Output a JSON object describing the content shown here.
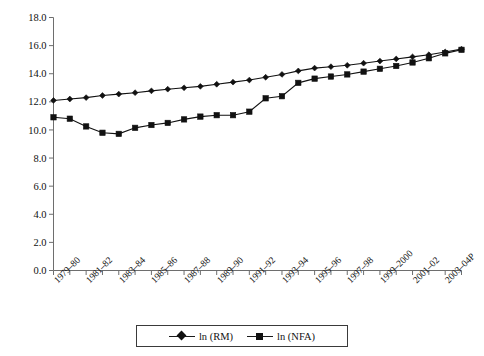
{
  "chart_data": {
    "type": "line",
    "title": "",
    "subtitle": "",
    "xlabel": "",
    "ylabel": "",
    "ylim": [
      0.0,
      18.0
    ],
    "ytick_step": 2.0,
    "ytick_labels": [
      "0.0",
      "2.0",
      "4.0",
      "6.0",
      "8.0",
      "10.0",
      "12.0",
      "14.0",
      "16.0",
      "18.0"
    ],
    "ytick_values": [
      0.0,
      2.0,
      4.0,
      6.0,
      8.0,
      10.0,
      12.0,
      14.0,
      16.0,
      18.0
    ],
    "grid": false,
    "legend_position": "below-axis-center",
    "x": [
      "1979-80",
      "1980-81",
      "1981-82",
      "1982-83",
      "1983-84",
      "1984-85",
      "1985-86",
      "1986-87",
      "1987-88",
      "1988-89",
      "1989-90",
      "1990-91",
      "1991-92",
      "1992-93",
      "1993-94",
      "1994-95",
      "1995-96",
      "1996-97",
      "1997-98",
      "1998-99",
      "1999-2000",
      "2000-01",
      "2001-02",
      "2002-03",
      "2003-04P",
      "2004-05P"
    ],
    "xtick_labels_shown": [
      "1979-80",
      "1981-82",
      "1983-84",
      "1985-86",
      "1987-88",
      "1989-90",
      "1991-92",
      "1993-94",
      "1995-96",
      "1997-98",
      "1999-2000",
      "2001-02",
      "2003-04P"
    ],
    "series": [
      {
        "name": "ln (RM)",
        "marker": "diamond",
        "color": "#111111",
        "values": [
          12.1,
          12.2,
          12.3,
          12.45,
          12.55,
          12.65,
          12.78,
          12.9,
          13.0,
          13.1,
          13.25,
          13.4,
          13.55,
          13.75,
          13.95,
          14.2,
          14.4,
          14.5,
          14.6,
          14.75,
          14.9,
          15.05,
          15.2,
          15.35,
          15.55,
          15.75
        ]
      },
      {
        "name": "ln (NFA)",
        "marker": "square",
        "color": "#111111",
        "values": [
          10.9,
          10.8,
          10.25,
          9.8,
          9.72,
          10.15,
          10.35,
          10.5,
          10.75,
          10.95,
          11.05,
          11.05,
          11.3,
          12.25,
          12.4,
          13.35,
          13.65,
          13.8,
          13.95,
          14.15,
          14.35,
          14.55,
          14.8,
          15.1,
          15.45,
          15.7
        ]
      }
    ]
  },
  "legend": {
    "entries": [
      {
        "label": "ln (RM)",
        "marker": "diamond"
      },
      {
        "label": "ln (NFA)",
        "marker": "square"
      }
    ]
  },
  "axes": {
    "y_axis_name": "value-axis",
    "x_axis_name": "period-axis"
  }
}
